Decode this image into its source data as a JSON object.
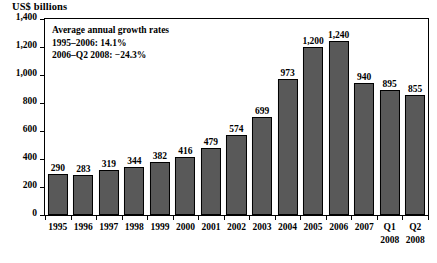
{
  "chart_data": {
    "type": "bar",
    "title": "US$ billions",
    "xlabel": "",
    "ylabel": "US$ billions",
    "ylim": [
      0,
      1400
    ],
    "ytick_step": 200,
    "grid": false,
    "legend": "none",
    "bar_color": "#595959",
    "bar_edge_color": "#000000",
    "categories": [
      {
        "line1": "1995",
        "line2": ""
      },
      {
        "line1": "1996",
        "line2": ""
      },
      {
        "line1": "1997",
        "line2": ""
      },
      {
        "line1": "1998",
        "line2": ""
      },
      {
        "line1": "1999",
        "line2": ""
      },
      {
        "line1": "2000",
        "line2": ""
      },
      {
        "line1": "2001",
        "line2": ""
      },
      {
        "line1": "2002",
        "line2": ""
      },
      {
        "line1": "2003",
        "line2": ""
      },
      {
        "line1": "2004",
        "line2": ""
      },
      {
        "line1": "2005",
        "line2": ""
      },
      {
        "line1": "2006",
        "line2": ""
      },
      {
        "line1": "2007",
        "line2": ""
      },
      {
        "line1": "Q1",
        "line2": "2008"
      },
      {
        "line1": "Q2",
        "line2": "2008"
      }
    ],
    "values": [
      290,
      283,
      319,
      344,
      382,
      416,
      479,
      574,
      699,
      973,
      1200,
      1240,
      940,
      895,
      855
    ],
    "value_labels": [
      "290",
      "283",
      "319",
      "344",
      "382",
      "416",
      "479",
      "574",
      "699",
      "973",
      "1,200",
      "1,240",
      "940",
      "895",
      "855"
    ],
    "ytick_labels": [
      "1,400",
      "1,200",
      "1,000",
      "800",
      "600",
      "400",
      "200",
      "0"
    ],
    "ytick_values": [
      1400,
      1200,
      1000,
      800,
      600,
      400,
      200,
      0
    ],
    "annotations": [
      "Average annual growth rates",
      "1995–2006: 14.1%",
      "2006–Q2 2008: −24.3%"
    ]
  }
}
